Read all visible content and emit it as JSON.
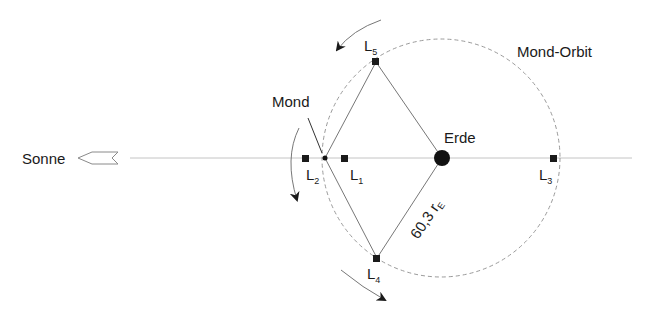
{
  "diagram": {
    "labels": {
      "sun": "Sonne",
      "moon": "Mond",
      "earth": "Erde",
      "orbit": "Mond-Orbit",
      "distance": "60,3 r",
      "distance_sub": "E"
    },
    "lagrange_points": [
      {
        "id": "L1",
        "main": "L",
        "sub": "1"
      },
      {
        "id": "L2",
        "main": "L",
        "sub": "2"
      },
      {
        "id": "L3",
        "main": "L",
        "sub": "3"
      },
      {
        "id": "L4",
        "main": "L",
        "sub": "4"
      },
      {
        "id": "L5",
        "main": "L",
        "sub": "5"
      }
    ],
    "colors": {
      "line": "#b5b5b5",
      "dark": "#1a1a1a",
      "orbit": "#9a9a9a"
    }
  }
}
